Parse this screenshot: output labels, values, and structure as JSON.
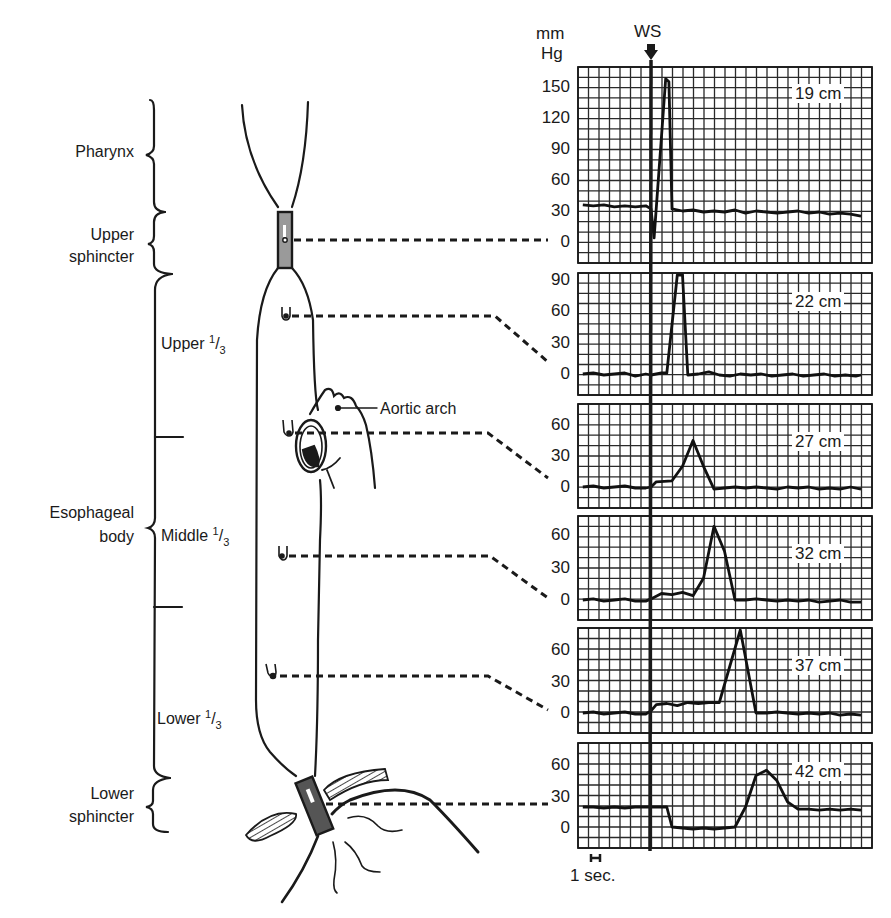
{
  "figure": {
    "unit_label_line1": "mm",
    "unit_label_line2": "Hg",
    "event_marker": "WS",
    "time_scale_label": "1 sec.",
    "aortic_arch_label": "Aortic arch"
  },
  "regions": [
    {
      "id": "pharynx",
      "label": "Pharynx"
    },
    {
      "id": "upper-sphincter",
      "label_line1": "Upper",
      "label_line2": "sphincter"
    },
    {
      "id": "esophageal-body",
      "label_line1": "Esophageal",
      "label_line2": "body"
    },
    {
      "id": "lower-sphincter",
      "label_line1": "Lower",
      "label_line2": "sphincter"
    }
  ],
  "subregions": [
    {
      "id": "upper-third",
      "label": "Upper",
      "frac_num": "1",
      "frac_den": "3"
    },
    {
      "id": "middle-third",
      "label": "Middle",
      "frac_num": "1",
      "frac_den": "3"
    },
    {
      "id": "lower-third",
      "label": "Lower",
      "frac_num": "1",
      "frac_den": "3"
    }
  ],
  "colors": {
    "ink": "#1a1a1a",
    "grid": "#2a2a2a",
    "paper": "#ffffff",
    "sphincter_fill": "#9a9a9a"
  },
  "chart_data": {
    "type": "line",
    "xlabel": "time (1 sec per major grid division)",
    "ylabel": "mm Hg",
    "ws_time_s": 0,
    "panels": [
      {
        "label": "19 cm",
        "ticks": [
          "150",
          "120",
          "90",
          "60",
          "30",
          "0"
        ],
        "ylim": [
          -20,
          165
        ],
        "t": [
          -6.5,
          -5.5,
          -4.5,
          -3.5,
          -2.5,
          -1.5,
          -0.5,
          0,
          0.3,
          1.4,
          1.7,
          2,
          3,
          4,
          5,
          6,
          7,
          8,
          9,
          10,
          11,
          12,
          13,
          14,
          15,
          16,
          17,
          18,
          19,
          20
        ],
        "p": [
          36,
          35,
          36,
          34,
          35,
          34,
          35,
          32,
          4,
          158,
          155,
          32,
          30,
          31,
          29,
          30,
          29,
          31,
          28,
          30,
          29,
          28,
          29,
          30,
          28,
          29,
          27,
          28,
          27,
          25
        ]
      },
      {
        "label": "22 cm",
        "ticks": [
          "90",
          "60",
          "30",
          "0"
        ],
        "ylim": [
          -15,
          100
        ],
        "t": [
          -6.5,
          -5.5,
          -4.5,
          -3.5,
          -2.5,
          -1.5,
          -0.5,
          0,
          1,
          1.5,
          2.5,
          3,
          3.5,
          4.5,
          5.5,
          6.5,
          7.5,
          8.5,
          9.5,
          10.5,
          11.5,
          12.5,
          13.5,
          14.5,
          15.5,
          16.5,
          17.5,
          18.5,
          19.5,
          20
        ],
        "p": [
          0,
          1,
          -1,
          0,
          1,
          -2,
          0,
          -1,
          1,
          1,
          95,
          95,
          -1,
          0,
          2,
          -1,
          -2,
          0,
          -1,
          0,
          -2,
          -1,
          0,
          -2,
          -1,
          0,
          -2,
          -1,
          -2,
          -1
        ]
      },
      {
        "label": "27 cm",
        "ticks": [
          "60",
          "30",
          "0"
        ],
        "ylim": [
          -15,
          70
        ],
        "t": [
          -6.5,
          -5.5,
          -4.5,
          -3.5,
          -2.5,
          -1.5,
          -0.5,
          0,
          0.5,
          2,
          3,
          4,
          5,
          6,
          7,
          8,
          9,
          10,
          11,
          12,
          13,
          14,
          15,
          16,
          17,
          18,
          19,
          20
        ],
        "p": [
          0,
          1,
          -1,
          0,
          1,
          -1,
          -1,
          0,
          5,
          6,
          20,
          45,
          20,
          -2,
          -1,
          0,
          -1,
          0,
          -1,
          -2,
          0,
          -1,
          0,
          -2,
          -1,
          -2,
          0,
          -2
        ]
      },
      {
        "label": "32 cm",
        "ticks": [
          "60",
          "30",
          "0"
        ],
        "ylim": [
          -15,
          70
        ],
        "t": [
          -6.5,
          -5.5,
          -4.5,
          -3.5,
          -2.5,
          -1.5,
          -0.5,
          0,
          1,
          2,
          3,
          4,
          5,
          6,
          7,
          8,
          9,
          10,
          11,
          12,
          13,
          14,
          15,
          16,
          17,
          18,
          19,
          20
        ],
        "p": [
          0,
          1,
          -1,
          0,
          1,
          -1,
          -1,
          1,
          6,
          5,
          7,
          4,
          20,
          68,
          45,
          0,
          0,
          1,
          0,
          -1,
          0,
          -1,
          0,
          -2,
          -1,
          0,
          -2,
          -2
        ]
      },
      {
        "label": "37 cm",
        "ticks": [
          "60",
          "30",
          "0"
        ],
        "ylim": [
          -15,
          80
        ],
        "t": [
          -6.5,
          -5.5,
          -4.5,
          -3.5,
          -2.5,
          -1.5,
          -0.5,
          0,
          0.5,
          1.5,
          2.5,
          3.5,
          4.5,
          5.5,
          6.5,
          8.5,
          10,
          11,
          12,
          13,
          14,
          15,
          16,
          17,
          18,
          19,
          20
        ],
        "p": [
          0,
          1,
          -1,
          0,
          1,
          -1,
          -1,
          2,
          8,
          9,
          7,
          10,
          9,
          10,
          10,
          80,
          0,
          0,
          1,
          0,
          -1,
          0,
          -1,
          0,
          -2,
          -1,
          -2
        ]
      },
      {
        "label": "42 cm",
        "ticks": [
          "60",
          "30",
          "0"
        ],
        "ylim": [
          -15,
          70
        ],
        "t": [
          -6.5,
          -5.5,
          -4.5,
          -3.5,
          -2.5,
          -1.5,
          -0.5,
          0,
          1,
          1.5,
          2,
          3,
          4,
          5,
          6,
          7,
          8,
          9,
          9.5,
          10,
          11,
          12,
          13,
          14,
          15,
          16,
          17,
          18,
          19,
          20
        ],
        "p": [
          20,
          20,
          19,
          20,
          19,
          20,
          20,
          20,
          20,
          20,
          1,
          0,
          -1,
          0,
          -1,
          0,
          1,
          20,
          35,
          50,
          55,
          45,
          25,
          18,
          18,
          17,
          18,
          17,
          18,
          17
        ]
      }
    ]
  }
}
